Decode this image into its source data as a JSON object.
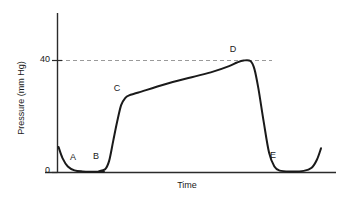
{
  "chart_data": {
    "type": "line",
    "title": "",
    "xlabel": "Time",
    "ylabel": "Pressure (mm Hg)",
    "ylim": [
      0,
      56
    ],
    "xlim": [
      0,
      100
    ],
    "yticks": [
      0,
      40
    ],
    "ytick_labels": [
      "0",
      "40"
    ],
    "xticks": [],
    "xtick_labels": [],
    "grid": false,
    "legend": null,
    "reference_lines": [
      {
        "name": "peak-pressure-dashed",
        "orientation": "horizontal",
        "value": 40,
        "style": "dashed",
        "color": "#9a9a9a",
        "x_start": 0,
        "x_end": 77
      }
    ],
    "series": [
      {
        "name": "pressure-trace",
        "color": "#1a1a1a",
        "points": [
          {
            "x": 0.0,
            "y": 9.0
          },
          {
            "x": 1.5,
            "y": 5.0
          },
          {
            "x": 3.5,
            "y": 2.0
          },
          {
            "x": 6.0,
            "y": 0.6
          },
          {
            "x": 9.0,
            "y": 0.2
          },
          {
            "x": 13.0,
            "y": 0.1
          },
          {
            "x": 17.0,
            "y": 0.1
          },
          {
            "x": 15.0,
            "y": 0.2
          },
          {
            "x": 17.5,
            "y": 1.0
          },
          {
            "x": 19.0,
            "y": 4.0
          },
          {
            "x": 20.5,
            "y": 11.0
          },
          {
            "x": 22.0,
            "y": 18.0
          },
          {
            "x": 23.5,
            "y": 24.0
          },
          {
            "x": 25.0,
            "y": 26.5
          },
          {
            "x": 26.5,
            "y": 27.5
          },
          {
            "x": 30.0,
            "y": 28.5
          },
          {
            "x": 40.0,
            "y": 31.5
          },
          {
            "x": 50.0,
            "y": 34.0
          },
          {
            "x": 58.0,
            "y": 36.0
          },
          {
            "x": 64.0,
            "y": 38.0
          },
          {
            "x": 67.0,
            "y": 39.3
          },
          {
            "x": 69.5,
            "y": 40.0
          },
          {
            "x": 72.0,
            "y": 39.8
          },
          {
            "x": 73.5,
            "y": 37.0
          },
          {
            "x": 75.0,
            "y": 30.0
          },
          {
            "x": 77.0,
            "y": 18.0
          },
          {
            "x": 79.0,
            "y": 7.0
          },
          {
            "x": 81.0,
            "y": 2.0
          },
          {
            "x": 83.0,
            "y": 0.5
          },
          {
            "x": 87.0,
            "y": 0.2
          },
          {
            "x": 92.0,
            "y": 0.4
          },
          {
            "x": 95.0,
            "y": 1.5
          },
          {
            "x": 97.0,
            "y": 4.5
          },
          {
            "x": 98.5,
            "y": 8.5
          }
        ],
        "annotations": [
          {
            "label": "A",
            "x": 6.0,
            "y": 0.6
          },
          {
            "label": "B",
            "x": 14.5,
            "y": 0.1
          },
          {
            "label": "C",
            "x": 25.0,
            "y": 27.5
          },
          {
            "label": "D",
            "x": 69.5,
            "y": 40.0
          },
          {
            "label": "E",
            "x": 87.0,
            "y": 0.2
          }
        ]
      }
    ]
  },
  "axes": {
    "y_title": "Pressure (mm Hg)",
    "x_title": "Time",
    "y_tick_top": "40",
    "y_tick_bottom": "0"
  },
  "labels": {
    "a": "A",
    "b": "B",
    "c": "C",
    "d": "D",
    "e": "E"
  },
  "colors": {
    "curve": "#1a1a1a",
    "axis": "#2b2b2b",
    "dashed": "#9a9a9a",
    "text": "#1a1a1a",
    "background": "#ffffff"
  }
}
